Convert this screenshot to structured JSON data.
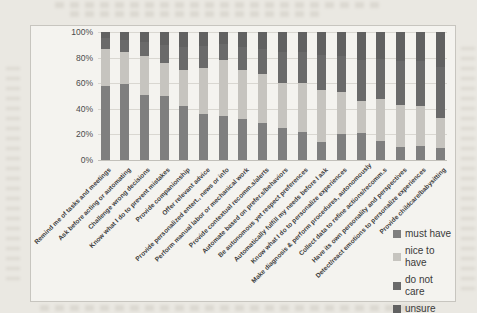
{
  "chart_data": {
    "type": "bar",
    "stacked": true,
    "percent_stacked": true,
    "title": "",
    "xlabel": "",
    "ylabel": "",
    "ylim": [
      0,
      100
    ],
    "grid": true,
    "legend_position": "right-bottom",
    "y_ticks": [
      "100%",
      "80%",
      "60%",
      "40%",
      "20%",
      "0%"
    ],
    "categories": [
      "Remind me of tasks and meetings",
      "Ask before acting or automating",
      "Challenge wrong decisions",
      "Know what I do to prevent mistakes",
      "Provide companionship",
      "Offer relevant advice",
      "Provide personalized entert., news or info",
      "Perform manual labor or mechanical work",
      "Provide contextual recomm.s/alerts",
      "Automate based on prefer.s/behaviors",
      "Be autonomous yet respect preferences",
      "Automatically fulfill my needs before I ask",
      "Know what I do to personalize experiences",
      "Make diagnosis & perform procedures, autonomously",
      "Collect data to refine actions/recomm.s",
      "Have its own personality and perspectives",
      "Detect/react emotions to personalize experiences",
      "Provide childcare/babysitting"
    ],
    "series": [
      {
        "name": "must have",
        "color": "#7f7f7f",
        "values": [
          58,
          59,
          51,
          50,
          42,
          36,
          34,
          32,
          29,
          25,
          22,
          14,
          20,
          21,
          15,
          10,
          11,
          9
        ]
      },
      {
        "name": "nice to have",
        "color": "#c6c4bf",
        "values": [
          29,
          25,
          30,
          26,
          28,
          36,
          44,
          38,
          38,
          35,
          38,
          41,
          33,
          25,
          33,
          33,
          31,
          24
        ]
      },
      {
        "name": "do not care",
        "color": "#6a6a6a",
        "values": [
          8,
          10,
          11,
          14,
          18,
          17,
          13,
          18,
          20,
          24,
          24,
          27,
          28,
          32,
          31,
          34,
          35,
          40
        ]
      },
      {
        "name": "unsure",
        "color": "#616161",
        "values": [
          5,
          6,
          8,
          10,
          12,
          11,
          9,
          12,
          13,
          16,
          16,
          18,
          19,
          22,
          21,
          23,
          23,
          27
        ]
      }
    ]
  }
}
